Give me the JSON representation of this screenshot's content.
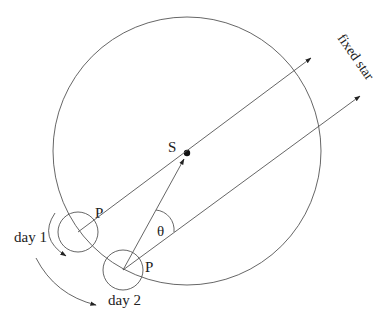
{
  "diagram": {
    "labels": {
      "sun": "S",
      "planet_day1": "P",
      "planet_day2": "P",
      "day1": "day 1",
      "day2": "day 2",
      "angle": "θ",
      "direction": "fixed star"
    },
    "colors": {
      "stroke": "#555555",
      "text": "#222222",
      "background": "#ffffff"
    }
  }
}
